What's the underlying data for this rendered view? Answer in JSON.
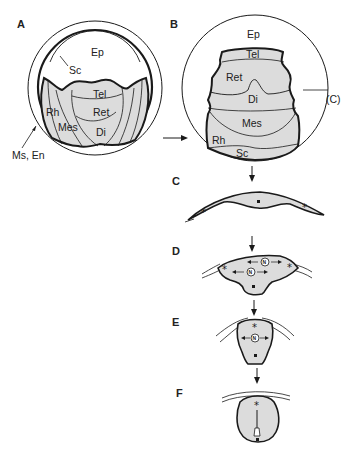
{
  "colors": {
    "ink": "#1a1a1a",
    "fill_light": "#e2e2e2",
    "fill_mid": "#d6d6d6",
    "background": "#ffffff"
  },
  "panels": {
    "A": {
      "label": "A",
      "regions": [
        "Ep",
        "Sc",
        "Tel",
        "Ret",
        "Rh",
        "Mes",
        "Di"
      ],
      "pointer_label": "Ms, En"
    },
    "B": {
      "label": "B",
      "regions": [
        "Ep",
        "Tel",
        "Ret",
        "Di",
        "Mes",
        "Rh",
        "Sc"
      ],
      "section_marker": "(C)"
    },
    "C": {
      "label": "C"
    },
    "D": {
      "label": "D"
    },
    "E": {
      "label": "E"
    },
    "F": {
      "label": "F"
    }
  },
  "labels": {
    "A_Ep": "Ep",
    "A_Sc": "Sc",
    "A_Tel": "Tel",
    "A_Ret": "Ret",
    "A_Rh": "Rh",
    "A_Mes": "Mes",
    "A_Di": "Di",
    "A_MsEn": "Ms, En",
    "B_Ep": "Ep",
    "B_Tel": "Tel",
    "B_Ret": "Ret",
    "B_Di": "Di",
    "B_Mes": "Mes",
    "B_Rh": "Rh",
    "B_Sc": "Sc",
    "B_C": "(C)"
  },
  "symbols": {
    "star": "*",
    "circled": "N"
  }
}
